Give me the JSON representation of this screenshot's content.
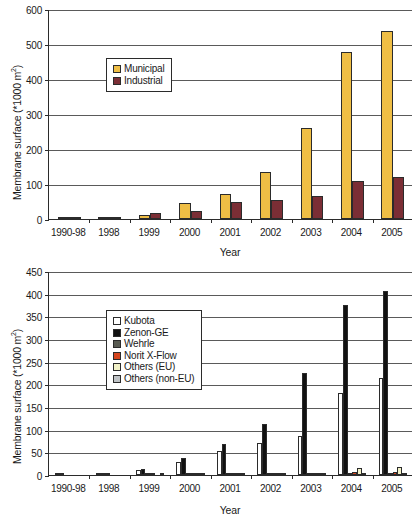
{
  "chart_data": [
    {
      "id": "top",
      "type": "bar",
      "title": "",
      "xlabel": "Year",
      "ylabel": "Membrane surface (*1000 m2)",
      "ylabel_prefix": "Membrane surface (",
      "ylabel_unit": "*1000 m",
      "ylabel_sup": "2",
      "ylabel_suffix": ")",
      "categories": [
        "1990-98",
        "1998",
        "1999",
        "2000",
        "2001",
        "2002",
        "2003",
        "2004",
        "2005"
      ],
      "ylim": [
        0,
        600
      ],
      "yticks": [
        0,
        100,
        200,
        300,
        400,
        500,
        600
      ],
      "grid": true,
      "legend_position": "upper-left-inside",
      "series": [
        {
          "name": "Municipal",
          "color": "#EFBE45",
          "values": [
            2,
            3,
            11,
            47,
            71,
            135,
            260,
            476,
            536
          ]
        },
        {
          "name": "Industrial",
          "color": "#7B2E35",
          "values": [
            3,
            5,
            16,
            22,
            50,
            55,
            66,
            110,
            120
          ]
        }
      ]
    },
    {
      "id": "bottom",
      "type": "bar",
      "title": "",
      "xlabel": "Year",
      "ylabel": "Membrane surface (*1000 m2)",
      "ylabel_prefix": "Membrane surface (",
      "ylabel_unit": "*1000 m",
      "ylabel_sup": "2",
      "ylabel_suffix": ")",
      "categories": [
        "1990-98",
        "1998",
        "1999",
        "2000",
        "2001",
        "2002",
        "2003",
        "2004",
        "2005"
      ],
      "ylim": [
        0,
        450
      ],
      "yticks": [
        0,
        50,
        100,
        150,
        200,
        250,
        300,
        350,
        400,
        450
      ],
      "grid": true,
      "legend_position": "upper-left-inside",
      "series": [
        {
          "name": "Kubota",
          "color": "#FFFFFF",
          "values": [
            1,
            2,
            11,
            29,
            52,
            70,
            87,
            180,
            214
          ]
        },
        {
          "name": "Zenon-GE",
          "color": "#111111",
          "values": [
            4,
            4,
            14,
            37,
            68,
            113,
            225,
            375,
            407
          ]
        },
        {
          "name": "Wehrle",
          "color": "#595B52",
          "values": [
            0,
            1,
            2,
            2,
            3,
            3,
            4,
            5,
            5
          ]
        },
        {
          "name": "Norit X-Flow",
          "color": "#D5451E",
          "values": [
            0,
            0,
            1,
            2,
            2,
            3,
            5,
            7,
            6
          ]
        },
        {
          "name": "Others (EU)",
          "color": "#F2F2C8",
          "values": [
            0,
            0,
            0,
            2,
            2,
            3,
            5,
            15,
            18
          ]
        },
        {
          "name": "Others (non-EU)",
          "color": "#BFC3C6",
          "values": [
            0,
            0,
            1,
            1,
            2,
            2,
            3,
            5,
            5
          ]
        }
      ]
    }
  ]
}
